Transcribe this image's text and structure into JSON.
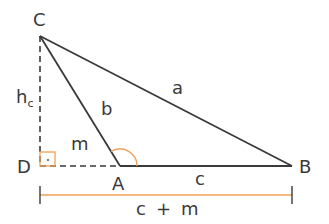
{
  "diagram": {
    "points": {
      "C": {
        "label": "C",
        "x": 40,
        "y": 36
      },
      "D": {
        "label": "D",
        "x": 40,
        "y": 166
      },
      "A": {
        "label": "A",
        "x": 120,
        "y": 166
      },
      "B": {
        "label": "B",
        "x": 292,
        "y": 166
      }
    },
    "segment_labels": {
      "a": "a",
      "b": "b",
      "c": "c",
      "m": "m",
      "h": "h",
      "h_sub": "c"
    },
    "measure_label": {
      "c": "c",
      "plus": "+",
      "m": "m"
    },
    "colors": {
      "line": "#3a3a3a",
      "accent": "#f0a05a"
    }
  }
}
